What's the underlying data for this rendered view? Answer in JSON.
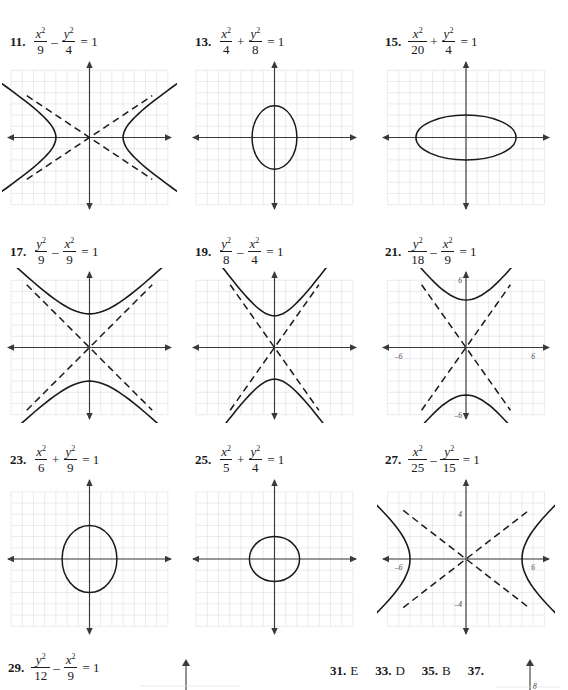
{
  "page": {
    "width": 568,
    "height": 690,
    "background": "#ffffff",
    "ink_color": "#1a1a1a",
    "grid_color": "#e3e1e8",
    "axis_color": "#3a3a3a"
  },
  "problems": [
    {
      "number": "11.",
      "equation": {
        "left_num": "x",
        "left_den": "9",
        "op": "–",
        "right_num": "y",
        "right_den": "4",
        "rhs": "= 1"
      },
      "graph": {
        "type": "hyperbola-horizontal",
        "a": 3,
        "b": 2,
        "asymptotes": true,
        "labels": [],
        "x": 10,
        "y": 60,
        "w": 175,
        "h": 155
      }
    },
    {
      "number": "13.",
      "equation": {
        "left_num": "x",
        "left_den": "4",
        "op": "+",
        "right_num": "y",
        "right_den": "8",
        "rhs": "= 1"
      },
      "graph": {
        "type": "ellipse-vertical",
        "a": 2,
        "b": 2.83,
        "asymptotes": false,
        "labels": [],
        "x": 195,
        "y": 60,
        "w": 175,
        "h": 155
      }
    },
    {
      "number": "15.",
      "equation": {
        "left_num": "x",
        "left_den": "20",
        "op": "+",
        "right_num": "y",
        "right_den": "4",
        "rhs": "= 1"
      },
      "graph": {
        "type": "ellipse-horizontal",
        "a": 4.47,
        "b": 2,
        "asymptotes": false,
        "labels": [],
        "x": 385,
        "y": 60,
        "w": 178,
        "h": 155
      }
    },
    {
      "number": "17.",
      "equation": {
        "left_num": "y",
        "left_den": "9",
        "op": "–",
        "right_num": "x",
        "right_den": "9",
        "rhs": "= 1"
      },
      "graph": {
        "type": "hyperbola-vertical",
        "a": 3,
        "b": 3,
        "asymptotes": true,
        "labels": [],
        "x": 10,
        "y": 270,
        "w": 175,
        "h": 155
      }
    },
    {
      "number": "19.",
      "equation": {
        "left_num": "y",
        "left_den": "8",
        "op": "–",
        "right_num": "x",
        "right_den": "4",
        "rhs": "= 1"
      },
      "graph": {
        "type": "hyperbola-vertical",
        "a": 2.83,
        "b": 2,
        "asymptotes": true,
        "labels": [],
        "x": 195,
        "y": 270,
        "w": 175,
        "h": 155
      }
    },
    {
      "number": "21.",
      "equation": {
        "left_num": "y",
        "left_den": "18",
        "op": "–",
        "right_num": "x",
        "right_den": "9",
        "rhs": "= 1"
      },
      "graph": {
        "type": "hyperbola-vertical",
        "a": 4.24,
        "b": 3,
        "asymptotes": true,
        "labels": [
          {
            "text": "6",
            "axis": "y",
            "value": 6
          },
          {
            "text": "–6",
            "axis": "y",
            "value": -6
          },
          {
            "text": "–6",
            "axis": "x",
            "value": -6
          },
          {
            "text": "6",
            "axis": "x",
            "value": 6
          }
        ],
        "x": 385,
        "y": 270,
        "w": 178,
        "h": 155
      }
    },
    {
      "number": "23.",
      "equation": {
        "left_num": "x",
        "left_den": "6",
        "op": "+",
        "right_num": "y",
        "right_den": "9",
        "rhs": "= 1"
      },
      "graph": {
        "type": "ellipse-vertical",
        "a": 2.45,
        "b": 3,
        "asymptotes": false,
        "labels": [],
        "x": 10,
        "y": 478,
        "w": 175,
        "h": 162
      }
    },
    {
      "number": "25.",
      "equation": {
        "left_num": "x",
        "left_den": "5",
        "op": "+",
        "right_num": "y",
        "right_den": "4",
        "rhs": "= 1"
      },
      "graph": {
        "type": "ellipse-vertical",
        "a": 2.24,
        "b": 2,
        "asymptotes": false,
        "labels": [],
        "x": 195,
        "y": 478,
        "w": 175,
        "h": 162
      }
    },
    {
      "number": "27.",
      "equation": {
        "left_num": "x",
        "left_den": "25",
        "op": "–",
        "right_num": "y",
        "right_den": "15",
        "rhs": "= 1"
      },
      "graph": {
        "type": "hyperbola-horizontal",
        "a": 5,
        "b": 3.87,
        "asymptotes": true,
        "labels": [
          {
            "text": "8",
            "axis": "y",
            "value": 8
          },
          {
            "text": "4",
            "axis": "y",
            "value": 4
          },
          {
            "text": "–4",
            "axis": "y",
            "value": -4
          },
          {
            "text": "–8",
            "axis": "y",
            "value": -8
          },
          {
            "text": "–6",
            "axis": "x",
            "value": -6
          },
          {
            "text": "6",
            "axis": "x",
            "value": 6
          }
        ],
        "x": 385,
        "y": 478,
        "w": 178,
        "h": 162
      }
    }
  ],
  "bottom_row": {
    "problem_29": {
      "number": "29.",
      "equation": {
        "left_num": "y",
        "left_den": "12",
        "op": "–",
        "right_num": "x",
        "right_den": "9",
        "rhs": "= 1"
      }
    },
    "answers": [
      {
        "number": "31.",
        "value": "E"
      },
      {
        "number": "33.",
        "value": "D"
      },
      {
        "number": "35.",
        "value": "B"
      },
      {
        "number": "37.",
        "value": ""
      }
    ]
  }
}
